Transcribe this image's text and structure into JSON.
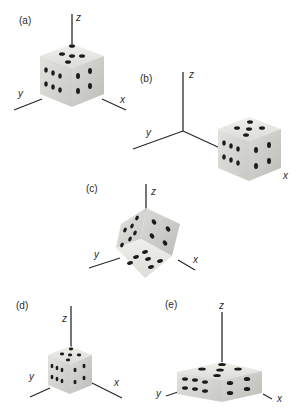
{
  "figure": {
    "panels": [
      {
        "id": "a",
        "label": "(a)",
        "axes": {
          "x": "x",
          "y": "y",
          "z": "z"
        },
        "note": "Die centered at origin, axis-aligned; top shows 5, left shows 6, right shows 4"
      },
      {
        "id": "b",
        "label": "(b)",
        "axes": {
          "x": "x",
          "y": "y",
          "z": "z"
        },
        "note": "Die translated along x axis away from origin"
      },
      {
        "id": "c",
        "label": "(c)",
        "axes": {
          "x": "x",
          "y": "y",
          "z": "z"
        },
        "note": "Die rotated; 5 face at bottom, 4 on right, 6 on left"
      },
      {
        "id": "d",
        "label": "(d)",
        "axes": {
          "x": "x",
          "y": "y",
          "z": "z"
        },
        "note": "Die scaled down uniformly"
      },
      {
        "id": "e",
        "label": "(e)",
        "axes": {
          "x": "x",
          "y": "y",
          "z": "z"
        },
        "note": "Die scaled non-uniformly (flattened in z, stretched in x/y)"
      }
    ]
  },
  "colors": {
    "axis": "#2b2b2b",
    "die_top": "#e6e6e2",
    "die_left": "#d8d8d4",
    "die_right": "#c9c9c5",
    "pip": "#1c1c1c",
    "label": "#2a2a2a"
  }
}
